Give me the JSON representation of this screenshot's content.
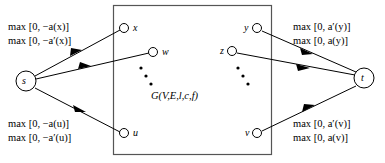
{
  "figure": {
    "type": "network-flow-diagram",
    "width": 385,
    "height": 163,
    "background_color": "#ffffff",
    "stroke_color": "#000000"
  },
  "box": {
    "label": "G(V,E,l,c,f)",
    "x": 113,
    "y": 5,
    "width": 159,
    "height": 150,
    "border_color": "#555555"
  },
  "terminals": {
    "source": {
      "label": "s",
      "cx": 26,
      "cy": 81,
      "r": 10
    },
    "sink": {
      "label": "t",
      "cx": 364,
      "cy": 78,
      "r": 10
    }
  },
  "nodes": [
    {
      "id": "x",
      "label": "x",
      "cx": 124,
      "cy": 28,
      "r": 4.5,
      "label_side": "right"
    },
    {
      "id": "w",
      "label": "w",
      "cx": 153,
      "cy": 52,
      "r": 4.5,
      "label_side": "right"
    },
    {
      "id": "u",
      "label": "u",
      "cx": 124,
      "cy": 133,
      "r": 4.5,
      "label_side": "right"
    },
    {
      "id": "y",
      "label": "y",
      "cx": 257,
      "cy": 28,
      "r": 4.5,
      "label_side": "left"
    },
    {
      "id": "z",
      "label": "z",
      "cx": 232,
      "cy": 51,
      "r": 4.5,
      "label_side": "left"
    },
    {
      "id": "v",
      "label": "v",
      "cx": 257,
      "cy": 133,
      "r": 4.5,
      "label_side": "left"
    }
  ],
  "ellipses": [
    {
      "id": "left-ellipsis",
      "dots": [
        {
          "x": 141,
          "y": 68
        },
        {
          "x": 146,
          "y": 76
        },
        {
          "x": 151,
          "y": 84
        }
      ]
    },
    {
      "id": "right-ellipsis",
      "dots": [
        {
          "x": 238,
          "y": 68
        },
        {
          "x": 243,
          "y": 76
        },
        {
          "x": 248,
          "y": 84
        }
      ]
    }
  ],
  "edges": [
    {
      "id": "s-to-x",
      "from": "s",
      "to": "x",
      "arrow_t": 0.55
    },
    {
      "id": "s-to-w",
      "from": "s",
      "to": "w",
      "arrow_t": 0.55
    },
    {
      "id": "s-to-u",
      "from": "s",
      "to": "u",
      "arrow_t": 0.52
    },
    {
      "id": "y-to-t",
      "from": "y",
      "to": "t",
      "arrow_t": 0.46
    },
    {
      "id": "z-to-t",
      "from": "z",
      "to": "t",
      "arrow_t": 0.52
    },
    {
      "id": "v-to-t",
      "from": "v",
      "to": "t",
      "arrow_t": 0.52
    }
  ],
  "labels": {
    "top_left": {
      "line1": "max [0, −a(x)]",
      "line2": "max [0, −a′(x)]"
    },
    "bottom_left": {
      "line1": "max [0, −a(u)]",
      "line2": "max [0, −a′(u)]"
    },
    "top_right": {
      "line1": "max [0, a′(y)]",
      "line2": "max [0, a(y)]"
    },
    "bottom_right": {
      "line1": "max [0, a′(v)]",
      "line2": "max [0, a(v)]"
    }
  }
}
